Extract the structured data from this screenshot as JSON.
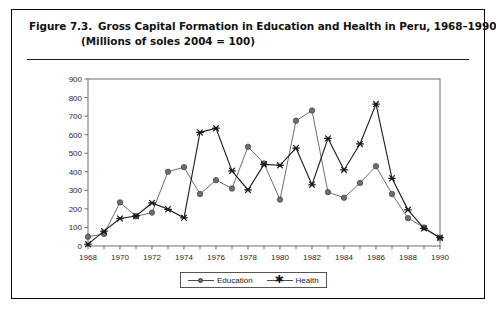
{
  "figure": {
    "label": "Figure 7.3.",
    "title_line1": "Gross Capital Formation in Education and Health in Peru, 1968–1990",
    "title_line2": "(Millions of soles 2004  =  100)"
  },
  "legend": {
    "position": "bottom-center",
    "entries": [
      {
        "name": "Education",
        "marker": "circle-marker",
        "color": "#6e6e6e"
      },
      {
        "name": "Health",
        "marker": "asterisk-marker",
        "color": "#1a1a1a"
      }
    ]
  },
  "axes": {
    "y_ticks": [
      "0",
      "100",
      "200",
      "300",
      "400",
      "500",
      "600",
      "700",
      "800",
      "900"
    ],
    "x_ticks_labeled": [
      "1968",
      "1970",
      "1972",
      "1974",
      "1976",
      "1978",
      "1980",
      "1982",
      "1984",
      "1986",
      "1988",
      "1990"
    ]
  },
  "chart_data": {
    "type": "line",
    "title": "Gross Capital Formation in Education and Health in Peru, 1968–1990",
    "subtitle": "(Millions of soles 2004 = 100)",
    "xlabel": "",
    "ylabel": "",
    "xlim": [
      1968,
      1990
    ],
    "ylim": [
      0,
      900
    ],
    "ytick_step": 100,
    "xtick_step": 1,
    "xtick_label_step": 2,
    "grid": false,
    "legend_position": "bottom-center",
    "x": [
      1968,
      1969,
      1970,
      1971,
      1972,
      1973,
      1974,
      1975,
      1976,
      1977,
      1978,
      1979,
      1980,
      1981,
      1982,
      1983,
      1984,
      1985,
      1986,
      1987,
      1988,
      1989,
      1990
    ],
    "categories": [
      "1968",
      "1969",
      "1970",
      "1971",
      "1972",
      "1973",
      "1974",
      "1975",
      "1976",
      "1977",
      "1978",
      "1979",
      "1980",
      "1981",
      "1982",
      "1983",
      "1984",
      "1985",
      "1986",
      "1987",
      "1988",
      "1989",
      "1990"
    ],
    "series": [
      {
        "name": "Education",
        "marker": "circle",
        "color": "#6e6e6e",
        "values": [
          50,
          65,
          235,
          160,
          180,
          400,
          425,
          280,
          355,
          310,
          535,
          445,
          250,
          675,
          730,
          290,
          260,
          340,
          430,
          280,
          150,
          100,
          45
        ]
      },
      {
        "name": "Health",
        "marker": "asterisk",
        "color": "#1a1a1a",
        "values": [
          10,
          80,
          148,
          162,
          232,
          198,
          152,
          612,
          635,
          405,
          302,
          440,
          435,
          528,
          330,
          580,
          410,
          550,
          765,
          365,
          195,
          95,
          45
        ]
      }
    ]
  }
}
